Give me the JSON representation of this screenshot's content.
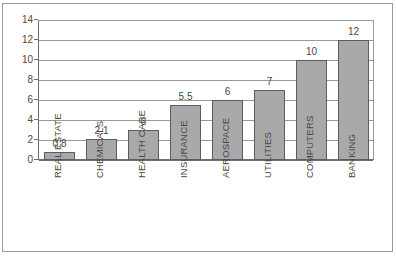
{
  "chart_data": {
    "type": "bar",
    "title": "",
    "subtitle": "",
    "xlabel": "",
    "ylabel": "",
    "categories": [
      "REAL ESTATE",
      "CHEMICALS",
      "HEALTH CARE",
      "INSURANCE",
      "AEROSPACE",
      "UTILITIES",
      "COMPUTERS",
      "BANKING"
    ],
    "values": [
      0.8,
      2.1,
      3,
      5.5,
      6,
      7,
      10,
      12
    ],
    "value_labels": [
      "0.8",
      "2.1",
      "3",
      "5.5",
      "6",
      "7",
      "10",
      "12"
    ],
    "ylim": [
      0,
      14
    ],
    "yticks": [
      0,
      2,
      4,
      6,
      8,
      10,
      12,
      14
    ],
    "ytick_labels": [
      "0",
      "2",
      "4",
      "6",
      "8",
      "10",
      "12",
      "14"
    ],
    "grid": true,
    "grid_axis": "y",
    "legend": false,
    "legend_position": "none",
    "bar_fill_color": "#a9a9a9",
    "bar_edge_color": "#5d5d5d",
    "gridline_color": "#9a9a9a",
    "axis_color": "#6e6e6e",
    "text_color": "#4a4a4a",
    "background_color": "#ffffff",
    "category_label_rotation": -90,
    "value_labels_shown": true
  }
}
